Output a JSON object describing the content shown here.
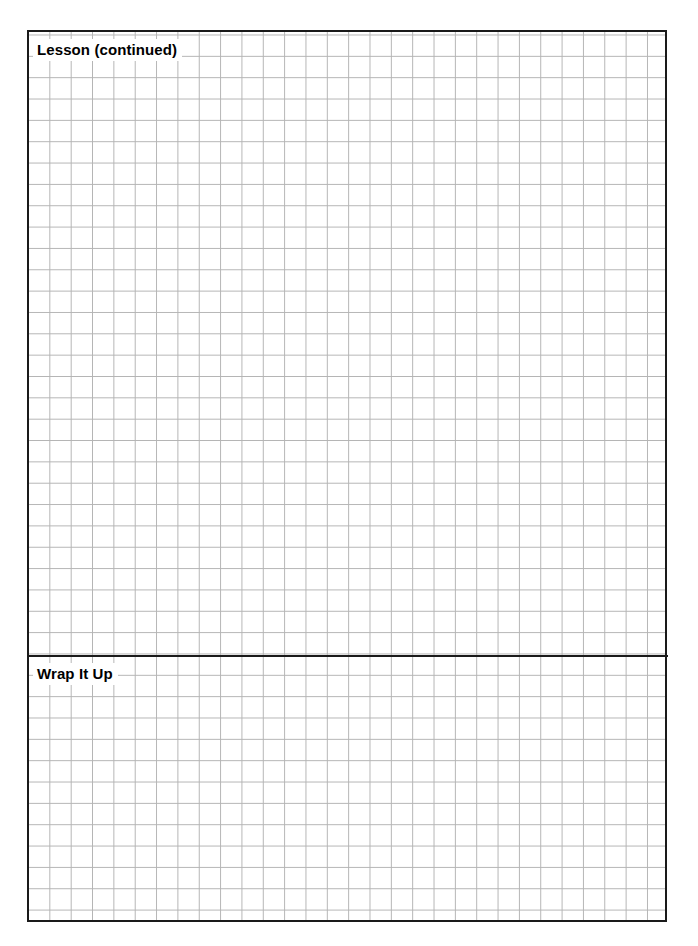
{
  "document": {
    "type": "worksheet-page",
    "paper": "graph-ruled",
    "background_color": "#ffffff",
    "frame_color": "#1a1a1a",
    "grid_color": "#b4b4b4",
    "grid_cell_px": 21.35
  },
  "sections": [
    {
      "id": "lesson-continued",
      "heading": "Lesson (continued)",
      "note_area": ""
    },
    {
      "id": "wrap-it-up",
      "heading": "Wrap It Up",
      "note_area": ""
    }
  ]
}
